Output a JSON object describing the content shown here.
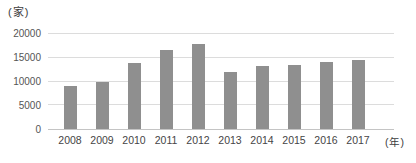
{
  "chart_data": {
    "type": "bar",
    "title": "",
    "y_unit_label": "(家)",
    "x_unit_label": "(年)",
    "categories": [
      "2008",
      "2009",
      "2010",
      "2011",
      "2012",
      "2013",
      "2014",
      "2015",
      "2016",
      "2017"
    ],
    "values": [
      9000,
      10000,
      14000,
      16600,
      18000,
      12100,
      13200,
      13400,
      14200,
      14500
    ],
    "xlabel": "年",
    "ylabel": "家",
    "ylim": [
      0,
      20000
    ],
    "y_ticks": [
      0,
      5000,
      10000,
      15000,
      20000
    ],
    "grid": "horizontal",
    "legend": "none",
    "bar_color": "#8f8f8f",
    "gridline_color": "#dcdcdc",
    "axis_line_color": "#c4c4c4",
    "axis_text_color": "#555555"
  }
}
